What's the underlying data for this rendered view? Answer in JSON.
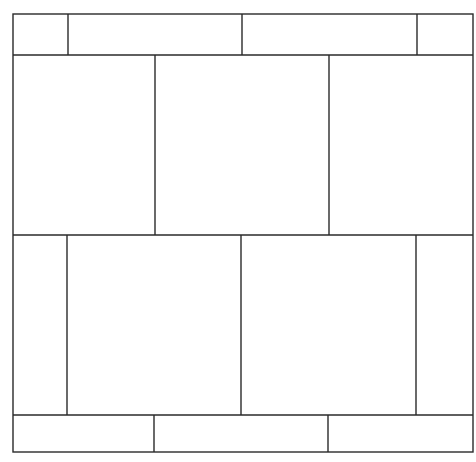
{
  "diagram": {
    "title": "",
    "outer": {
      "x": 13,
      "y": 14,
      "w": 460,
      "h": 438
    },
    "rows": [
      {
        "name": "top-strip",
        "y0": 14,
        "y1": 55,
        "dividers": [
          68,
          242,
          417
        ]
      },
      {
        "name": "upper-panels",
        "y0": 55,
        "y1": 235,
        "dividers": [
          155,
          329
        ]
      },
      {
        "name": "lower-panels",
        "y0": 235,
        "y1": 415,
        "dividers": [
          67,
          241,
          416
        ]
      },
      {
        "name": "bottom-strip",
        "y0": 415,
        "y1": 452,
        "dividers": [
          154,
          328
        ]
      }
    ],
    "line_color": "#2a2a2a",
    "background": "#ffffff"
  }
}
